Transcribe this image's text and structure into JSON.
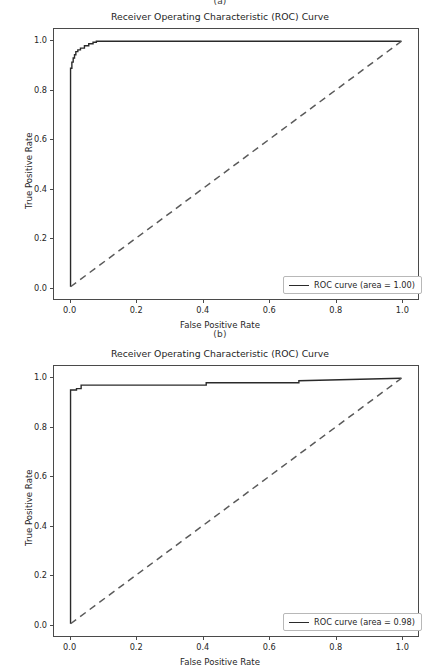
{
  "figure": {
    "panel_a_caption": "(a)",
    "panel_b_caption": "(b)",
    "axis_color": "#4a4a4a",
    "curve_color": "#2a2a2a",
    "chance_line_color": "#5a5a5a",
    "background": "#ffffff"
  },
  "chart_data": [
    {
      "id": "roc-panel-a",
      "panel": "(a)",
      "type": "line",
      "title": "Receiver Operating Characteristic (ROC) Curve",
      "xlabel": "False Positive Rate",
      "ylabel": "True Positive Rate",
      "xlim": [
        -0.05,
        1.05
      ],
      "ylim": [
        -0.05,
        1.05
      ],
      "xticks": [
        0.0,
        0.2,
        0.4,
        0.6,
        0.8,
        1.0
      ],
      "yticks": [
        0.0,
        0.2,
        0.4,
        0.6,
        0.8,
        1.0
      ],
      "xticklabels": [
        "0.0",
        "0.2",
        "0.4",
        "0.6",
        "0.8",
        "1.0"
      ],
      "yticklabels": [
        "0.0",
        "0.2",
        "0.4",
        "0.6",
        "0.8",
        "1.0"
      ],
      "grid": false,
      "legend_position": "lower right",
      "auc": 1.0,
      "legend": [
        "ROC curve (area = 1.00)"
      ],
      "series": [
        {
          "name": "ROC curve (area = 1.00)",
          "style": "solid",
          "color": "#2a2a2a",
          "x": [
            0.0,
            0.0,
            0.004,
            0.004,
            0.008,
            0.008,
            0.012,
            0.012,
            0.016,
            0.016,
            0.022,
            0.022,
            0.03,
            0.03,
            0.042,
            0.042,
            0.055,
            0.055,
            0.068,
            0.068,
            0.078,
            0.078,
            1.0
          ],
          "y": [
            0.0,
            0.89,
            0.89,
            0.915,
            0.915,
            0.932,
            0.932,
            0.945,
            0.945,
            0.958,
            0.958,
            0.965,
            0.965,
            0.972,
            0.972,
            0.982,
            0.982,
            0.99,
            0.99,
            0.996,
            0.996,
            1.0,
            1.0
          ]
        },
        {
          "name": "chance",
          "style": "dashed",
          "color": "#5a5a5a",
          "x": [
            0.0,
            1.0
          ],
          "y": [
            0.0,
            1.0
          ]
        }
      ]
    },
    {
      "id": "roc-panel-b",
      "panel": "(b)",
      "type": "line",
      "title": "Receiver Operating Characteristic (ROC) Curve",
      "xlabel": "False Positive Rate",
      "ylabel": "True Positive Rate",
      "xlim": [
        -0.05,
        1.05
      ],
      "ylim": [
        -0.05,
        1.05
      ],
      "xticks": [
        0.0,
        0.2,
        0.4,
        0.6,
        0.8,
        1.0
      ],
      "yticks": [
        0.0,
        0.2,
        0.4,
        0.6,
        0.8,
        1.0
      ],
      "xticklabels": [
        "0.0",
        "0.2",
        "0.4",
        "0.6",
        "0.8",
        "1.0"
      ],
      "yticklabels": [
        "0.0",
        "0.2",
        "0.4",
        "0.6",
        "0.8",
        "1.0"
      ],
      "grid": false,
      "legend_position": "lower right",
      "auc": 0.98,
      "legend": [
        "ROC curve (area = 0.98)"
      ],
      "series": [
        {
          "name": "ROC curve (area = 0.98)",
          "style": "solid",
          "color": "#2a2a2a",
          "x": [
            0.0,
            0.0,
            0.018,
            0.018,
            0.032,
            0.032,
            0.41,
            0.41,
            0.69,
            0.69,
            1.0
          ],
          "y": [
            0.0,
            0.952,
            0.952,
            0.958,
            0.958,
            0.972,
            0.972,
            0.982,
            0.982,
            0.99,
            1.0
          ]
        },
        {
          "name": "chance",
          "style": "dashed",
          "color": "#5a5a5a",
          "x": [
            0.0,
            1.0
          ],
          "y": [
            0.0,
            1.0
          ]
        }
      ]
    }
  ]
}
